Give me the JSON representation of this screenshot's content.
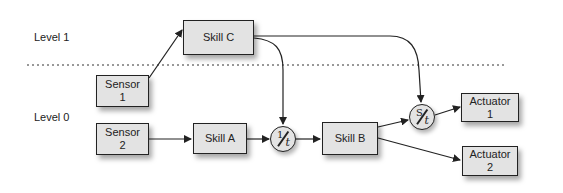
{
  "levels": [
    {
      "label": "Level 1"
    },
    {
      "label": "Level 0"
    }
  ],
  "nodes": {
    "skill_c": {
      "label": "Skill C"
    },
    "sensor_1": {
      "label": "Sensor\n1"
    },
    "sensor_2": {
      "label": "Sensor\n2"
    },
    "skill_a": {
      "label": "Skill A"
    },
    "skill_b": {
      "label": "Skill B"
    },
    "actuator_1": {
      "label": "Actuator\n1"
    },
    "actuator_2": {
      "label": "Actuator\n2"
    }
  },
  "operators": {
    "inverse_t": {
      "numerator": "1",
      "denominator": "t"
    },
    "s_over_t": {
      "numerator": "S",
      "denominator": "t"
    }
  },
  "edges": [
    {
      "from": "Sensor 1",
      "to": "Skill C"
    },
    {
      "from": "Sensor 2",
      "to": "Skill A"
    },
    {
      "from": "Skill A",
      "to": "1/t"
    },
    {
      "from": "Skill C",
      "to": "1/t"
    },
    {
      "from": "1/t",
      "to": "Skill B"
    },
    {
      "from": "Skill C",
      "to": "S/t"
    },
    {
      "from": "Skill B",
      "to": "S/t"
    },
    {
      "from": "S/t",
      "to": "Actuator 1"
    },
    {
      "from": "Skill B",
      "to": "Actuator 2"
    }
  ],
  "colors": {
    "box_fill": "#e3e3e3",
    "stroke": "#222222"
  }
}
